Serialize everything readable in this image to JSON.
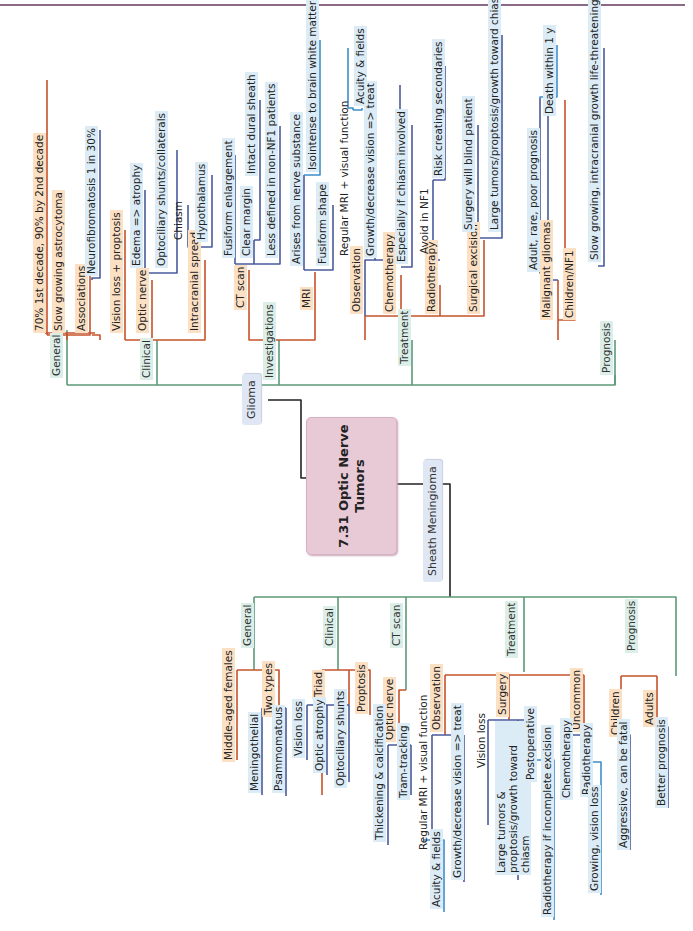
{
  "root": {
    "title_line1": "7.31 Optic Nerve",
    "title_line2": "Tumors"
  },
  "colors": {
    "root_fill": "#e8c9d6",
    "level2_line": "#5c9a78",
    "level3_line": "#c7532b",
    "level4_line": "#4a5b9c",
    "level5_line": "#3f8fcc",
    "level3_fill": "#fbe0c4",
    "level4_fill": "#dcecf7",
    "level2_fill": "#dbefe8"
  },
  "glioma": {
    "label": "Glioma",
    "general": {
      "label": "General",
      "items": [
        "70% 1st decade, 90% by 2nd decade",
        "Slow growing astrocytoma",
        "Associations"
      ],
      "associations_child": "Neurofibromatosis 1 in 30%"
    },
    "clinical": {
      "label": "Clinical",
      "items": [
        "Vision loss + proptosis",
        "Optic nerve",
        "Intracranial spread"
      ],
      "optic_nerve_children": [
        "Edema => atrophy",
        "Optociliary shunts/collaterals"
      ],
      "intracranial_children": [
        "Chiasm",
        "Hypothalamus"
      ]
    },
    "investigations": {
      "label": "Investigations",
      "ct_scan": {
        "label": "CT scan",
        "children": [
          "Fusiform enlargement",
          "Clear margin",
          "Less defined in non-NF1 patients"
        ],
        "clear_margin_child": "Intact dural sheath"
      },
      "mri": {
        "label": "MRI",
        "children": [
          "Arises from nerve substance",
          "Fusiform shape"
        ],
        "arises_child": "Isointense to brain white matter"
      }
    },
    "treatment": {
      "label": "Treatment",
      "observation": {
        "label": "Observation",
        "children": [
          "Regular MRI + visual function",
          "Growth/decrease vision => treat"
        ],
        "mri_child": "Acuity & fields"
      },
      "chemotherapy": {
        "label": "Chemotherapy",
        "children": [
          "Especially if chiasm involved"
        ]
      },
      "radiotherapy": {
        "label": "Radiotherapy",
        "children": [
          "Avoid in NF1"
        ],
        "avoid_child": "Risk creating secondaries"
      },
      "surgical_excision": {
        "label": "Surgical excision",
        "children": [
          "Surgery will blind patient",
          "Large tumors/proptosis/growth toward chiasm"
        ]
      }
    },
    "prognosis": {
      "label": "Prognosis",
      "malignant": {
        "label": "Malignant gliomas",
        "children": [
          "Adult, rare, poor prognosis"
        ],
        "adult_child": "Death within 1 y"
      },
      "children_nf1": {
        "label": "Children/NF1",
        "children": [
          "Slow growing, intracranial growth life-threatening"
        ]
      }
    }
  },
  "meningioma": {
    "label": "Sheath Meningioma",
    "general": {
      "label": "General",
      "items": [
        "Middle-aged females",
        "Two types"
      ],
      "types": [
        "Meningothelial",
        "Psammomatous"
      ]
    },
    "clinical": {
      "label": "Clinical",
      "items": [
        "Triad",
        "Proptosis"
      ],
      "triad": [
        "Vision loss",
        "Optic atrophy",
        "Optociliary shunts"
      ]
    },
    "ct_scan": {
      "label": "CT scan",
      "items": [
        "Optic nerve"
      ],
      "optic_nerve": [
        "Thickening & calcification",
        "Tram-tracking"
      ]
    },
    "treatment": {
      "label": "Treatment",
      "observation": {
        "label": "Observation",
        "children": [
          "Regular MRI + visual function",
          "Growth/decrease vision => treat"
        ],
        "mri_child": "Acuity & fields"
      },
      "surgery": {
        "label": "Surgery",
        "children": [
          "Vision loss",
          "Large tumors & proptosis/growth toward chiasm",
          "Postoperative"
        ],
        "postop_child": "Radiotherapy if incomplete excision"
      },
      "uncommon": {
        "label": "Uncommon",
        "children": [
          "Chemotherapy",
          "Radiotherapy"
        ],
        "radio_child": "Growing, vision loss"
      }
    },
    "prognosis": {
      "label": "Prognosis",
      "children_group": {
        "label": "Children",
        "child": "Aggressive, can be fatal"
      },
      "adults": {
        "label": "Adults",
        "child": "Better prognosis"
      }
    }
  }
}
